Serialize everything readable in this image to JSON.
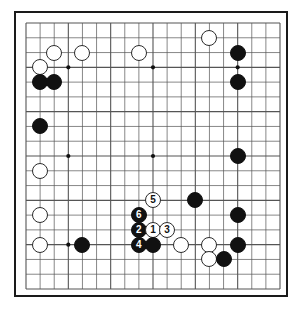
{
  "figure": {
    "kind": "go-board-diagram",
    "board_size": 19,
    "background_color": "#ffffff",
    "board_border_color": "#1a1a1a",
    "grid_line_color": "#555555",
    "black_color": "#111111",
    "white_color": "#ffffff"
  },
  "board": {
    "star_points": [
      {
        "col": 4,
        "row": 4
      },
      {
        "col": 10,
        "row": 4
      },
      {
        "col": 16,
        "row": 4
      },
      {
        "col": 4,
        "row": 10
      },
      {
        "col": 10,
        "row": 10
      },
      {
        "col": 16,
        "row": 10
      },
      {
        "col": 4,
        "row": 16
      },
      {
        "col": 10,
        "row": 16
      },
      {
        "col": 16,
        "row": 16
      }
    ],
    "stones": [
      {
        "col": 14,
        "row": 2,
        "color": "white",
        "label": ""
      },
      {
        "col": 3,
        "row": 3,
        "color": "white",
        "label": ""
      },
      {
        "col": 5,
        "row": 3,
        "color": "white",
        "label": ""
      },
      {
        "col": 9,
        "row": 3,
        "color": "white",
        "label": ""
      },
      {
        "col": 16,
        "row": 3,
        "color": "black",
        "label": ""
      },
      {
        "col": 2,
        "row": 4,
        "color": "white",
        "label": ""
      },
      {
        "col": 2,
        "row": 5,
        "color": "black",
        "label": ""
      },
      {
        "col": 3,
        "row": 5,
        "color": "black",
        "label": ""
      },
      {
        "col": 16,
        "row": 5,
        "color": "black",
        "label": ""
      },
      {
        "col": 2,
        "row": 8,
        "color": "black",
        "label": ""
      },
      {
        "col": 16,
        "row": 10,
        "color": "black",
        "label": ""
      },
      {
        "col": 2,
        "row": 11,
        "color": "white",
        "label": ""
      },
      {
        "col": 10,
        "row": 13,
        "color": "white",
        "label": "5"
      },
      {
        "col": 13,
        "row": 13,
        "color": "black",
        "label": ""
      },
      {
        "col": 2,
        "row": 14,
        "color": "white",
        "label": ""
      },
      {
        "col": 9,
        "row": 14,
        "color": "black",
        "label": "6"
      },
      {
        "col": 16,
        "row": 14,
        "color": "black",
        "label": ""
      },
      {
        "col": 9,
        "row": 15,
        "color": "black",
        "label": "2"
      },
      {
        "col": 10,
        "row": 15,
        "color": "white",
        "label": "1"
      },
      {
        "col": 11,
        "row": 15,
        "color": "white",
        "label": "3"
      },
      {
        "col": 2,
        "row": 16,
        "color": "white",
        "label": ""
      },
      {
        "col": 5,
        "row": 16,
        "color": "black",
        "label": ""
      },
      {
        "col": 9,
        "row": 16,
        "color": "black",
        "label": "4"
      },
      {
        "col": 10,
        "row": 16,
        "color": "black",
        "label": ""
      },
      {
        "col": 12,
        "row": 16,
        "color": "white",
        "label": ""
      },
      {
        "col": 14,
        "row": 16,
        "color": "white",
        "label": ""
      },
      {
        "col": 16,
        "row": 16,
        "color": "black",
        "label": ""
      },
      {
        "col": 14,
        "row": 17,
        "color": "white",
        "label": ""
      },
      {
        "col": 15,
        "row": 17,
        "color": "black",
        "label": ""
      }
    ],
    "move_sequence": [
      {
        "number": "1",
        "color": "white",
        "col": 10,
        "row": 15
      },
      {
        "number": "2",
        "color": "black",
        "col": 9,
        "row": 15
      },
      {
        "number": "3",
        "color": "white",
        "col": 11,
        "row": 15
      },
      {
        "number": "4",
        "color": "black",
        "col": 9,
        "row": 16
      },
      {
        "number": "5",
        "color": "white",
        "col": 10,
        "row": 13
      },
      {
        "number": "6",
        "color": "black",
        "col": 9,
        "row": 14
      }
    ]
  }
}
